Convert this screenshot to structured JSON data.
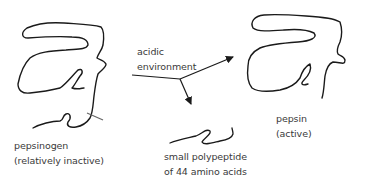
{
  "colors": {
    "line": "#1a1a1a",
    "text": "#3a3a3a",
    "cut_mark": "#666666",
    "background": "#ffffff"
  },
  "nodes": {
    "pepsinogen": {
      "name": "pepsinogen",
      "note": "(relatively inactive)"
    },
    "condition": {
      "line1": "acidic",
      "line2": "environment"
    },
    "pepsin": {
      "name": "pepsin",
      "note": "(active)"
    },
    "fragment": {
      "line1": "small polypeptide",
      "line2": "of 44 amino acids"
    }
  },
  "edges": [
    {
      "from": "pepsinogen",
      "to": "pepsin",
      "label": "acidic environment"
    },
    {
      "from": "pepsinogen",
      "to": "fragment"
    }
  ]
}
